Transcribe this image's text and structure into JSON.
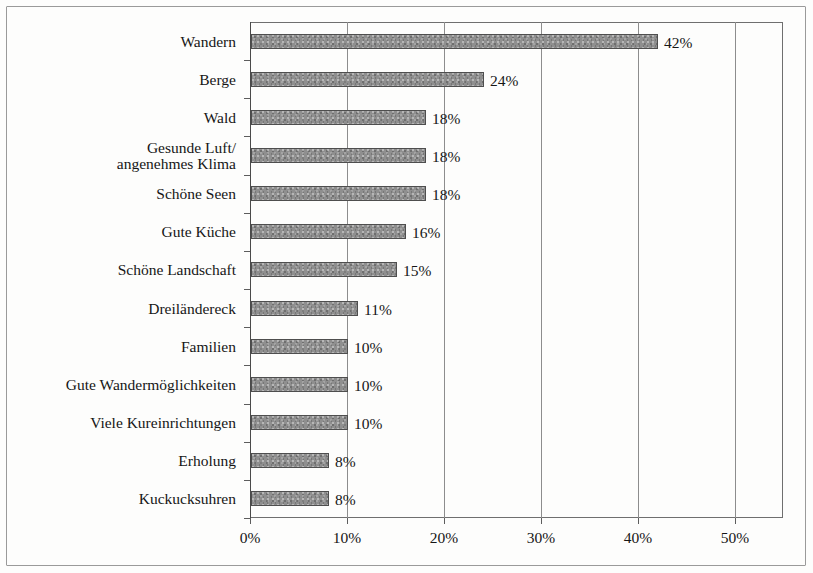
{
  "chart_data": {
    "type": "bar",
    "orientation": "horizontal",
    "title": "",
    "subtitle": "",
    "xlabel": "",
    "ylabel": "",
    "categories": [
      "Wandern",
      "Berge",
      "Wald",
      "Gesunde Luft/\nangenehmes Klima",
      "Schöne Seen",
      "Gute Küche",
      "Schöne Landschaft",
      "Dreiländereck",
      "Familien",
      "Gute Wandermöglichkeiten",
      "Viele Kureinrichtungen",
      "Erholung",
      "Kuckucksuhren"
    ],
    "values": [
      42,
      24,
      18,
      18,
      18,
      16,
      15,
      11,
      10,
      10,
      10,
      8,
      8
    ],
    "data_labels": [
      "42%",
      "24%",
      "18%",
      "18%",
      "18%",
      "16%",
      "15%",
      "11%",
      "10%",
      "10%",
      "10%",
      "8%",
      "8%"
    ],
    "xlim": [
      0,
      55
    ],
    "xticks": [
      0,
      10,
      20,
      30,
      40,
      50
    ],
    "xtick_labels": [
      "0%",
      "10%",
      "20%",
      "30%",
      "40%",
      "50%"
    ],
    "grid": "vertical",
    "legend": null,
    "bar_fill": "#8f8f8f",
    "bar_edge": "#4e4e4e",
    "axis_color": "#6f6f6f",
    "text_color": "#161616",
    "background": "#fdfdfc"
  }
}
